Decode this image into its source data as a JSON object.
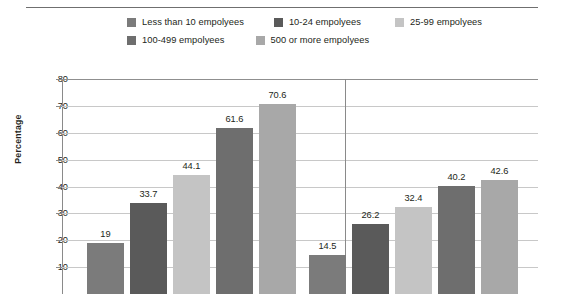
{
  "legend": {
    "rows": [
      [
        {
          "label": "Less than 10 empolyees",
          "color": "#7b7b7b"
        },
        {
          "label": "10-24 empolyees",
          "color": "#5a5a5a"
        },
        {
          "label": "25-99 empolyees",
          "color": "#c4c4c4"
        }
      ],
      [
        {
          "label": "100-499 empolyees",
          "color": "#6e6e6e"
        },
        {
          "label": "500 or more empolyees",
          "color": "#a8a8a8"
        }
      ]
    ]
  },
  "axis": {
    "y_title": "Percentage",
    "y_ticks": [
      "80",
      "70",
      "60",
      "50",
      "40",
      "30",
      "20",
      "10"
    ]
  },
  "chart_data": {
    "type": "bar",
    "title": "",
    "xlabel": "",
    "ylabel": "Percentage",
    "ylim": [
      0,
      80
    ],
    "ytick_step": 10,
    "grid": true,
    "legend_position": "top",
    "categories": [
      "Group 1",
      "Group 2"
    ],
    "series": [
      {
        "name": "Less than 10 empolyees",
        "color": "#7b7b7b",
        "values": [
          19,
          14.5
        ],
        "labels": [
          "19",
          "14.5"
        ]
      },
      {
        "name": "10-24 empolyees",
        "color": "#5a5a5a",
        "values": [
          33.7,
          26.2
        ],
        "labels": [
          "33.7",
          "26.2"
        ]
      },
      {
        "name": "25-99 empolyees",
        "color": "#c4c4c4",
        "values": [
          44.1,
          32.4
        ],
        "labels": [
          "44.1",
          "32.4"
        ]
      },
      {
        "name": "100-499 empolyees",
        "color": "#6e6e6e",
        "values": [
          61.6,
          40.2
        ],
        "labels": [
          "61.6",
          "40.2"
        ]
      },
      {
        "name": "500 or more empolyees",
        "color": "#a8a8a8",
        "values": [
          70.6,
          42.6
        ],
        "labels": [
          "70.6",
          "42.6"
        ]
      }
    ]
  }
}
